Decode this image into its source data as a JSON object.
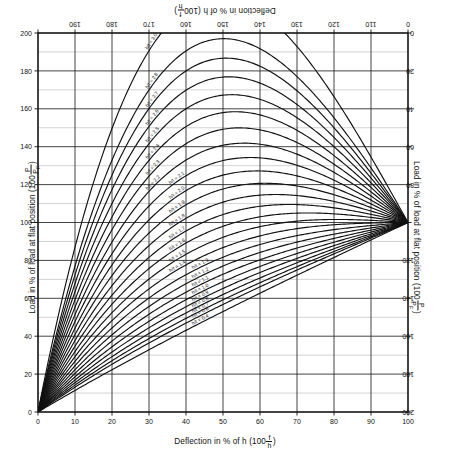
{
  "titles": {
    "top": "Deflection in % of h (100 f/h )",
    "bottom": "Deflection in % of h (100 f/h )",
    "left": "Load in % of load at flat position (100 P/P_F )",
    "right": "Load in % of load at flat position (100 P/P_F )",
    "bottom_prefix": "Deflection in % of h (100",
    "bottom_suffix": ")",
    "side_prefix": "Load in % of load at flat position (100",
    "side_suffix": ")",
    "frac_defl_num": "f",
    "frac_defl_den": "h",
    "frac_load_num": "P",
    "frac_load_den": "P",
    "frac_load_den_sub": "F"
  },
  "chart_data": {
    "type": "line",
    "xlabel": "Deflection in % of h (100 f/h)",
    "ylabel": "Load in % of load at flat position (100 P/P_F)",
    "xlim": [
      0,
      100
    ],
    "ylim": [
      0,
      200
    ],
    "grid": true,
    "legend": "inline-curve-labels",
    "x_ticks": [
      0,
      10,
      20,
      30,
      40,
      50,
      60,
      70,
      80,
      90,
      100
    ],
    "x_ticklabels": [
      "0",
      "10",
      "20",
      "30",
      "40",
      "50",
      "60",
      "70",
      "80",
      "90",
      "100"
    ],
    "y_ticks": [
      0,
      20,
      40,
      60,
      80,
      100,
      120,
      140,
      160,
      180,
      200
    ],
    "y_ticklabels": [
      "0",
      "20",
      "40",
      "60",
      "80",
      "100",
      "120",
      "140",
      "160",
      "180",
      "200"
    ],
    "top_axis_ticks": [
      10,
      20,
      30,
      40,
      50,
      60,
      70,
      80,
      90,
      100
    ],
    "top_axis_ticklabels": [
      "190",
      "180",
      "170",
      "160",
      "150",
      "140",
      "130",
      "120",
      "110",
      "0"
    ],
    "right_axis_ticks": [
      200,
      180,
      160,
      140,
      120,
      100,
      80,
      60,
      40,
      20,
      0
    ],
    "right_axis_ticklabels": [
      "0",
      "20",
      "40",
      "60",
      "80",
      "",
      "120",
      "140",
      "160",
      "180",
      "200"
    ],
    "x_minor_step": 10,
    "y_minor_step": 10,
    "converge_point": [
      100,
      100
    ],
    "origin_point": [
      0,
      0
    ],
    "series": [
      {
        "name": "h/t = 3.0",
        "ratio": 3.0,
        "label": "h/t = 3.0"
      },
      {
        "name": "h/t = 2.8",
        "ratio": 2.8,
        "label": "h/t = 2.8"
      },
      {
        "name": "h/t = 2.7",
        "ratio": 2.7,
        "label": "h/t = 2.7"
      },
      {
        "name": "h/t = 2.6",
        "ratio": 2.6,
        "label": "h/t = 2.6"
      },
      {
        "name": "h/t = 2.5",
        "ratio": 2.5,
        "label": "h/t = 2.5"
      },
      {
        "name": "h/t = 2.4",
        "ratio": 2.4,
        "label": "h/t = 2.4"
      },
      {
        "name": "h/t = 2.3",
        "ratio": 2.3,
        "label": "h/t = 2.3"
      },
      {
        "name": "h/t = 2.2",
        "ratio": 2.2,
        "label": "h/t = 2.2"
      },
      {
        "name": "h/t = 2.1",
        "ratio": 2.1,
        "label": "h/t = 2.1"
      },
      {
        "name": "h/t = 2.0",
        "ratio": 2.0,
        "label": "h/t = 2.0"
      },
      {
        "name": "h/t = 1.9",
        "ratio": 1.9,
        "label": "h/t = 1.9"
      },
      {
        "name": "h/t = 1.8",
        "ratio": 1.8,
        "label": "h/t = 1.8"
      },
      {
        "name": "h/t = 1.7",
        "ratio": 1.7,
        "label": "h/t = 1.7"
      },
      {
        "name": "h/t = 1.6",
        "ratio": 1.6,
        "label": "h/t = 1.6"
      },
      {
        "name": "h/t = 1.5",
        "ratio": 1.5,
        "label": "h/t = 1.5"
      },
      {
        "name": "h/t = 1.4",
        "ratio": 1.4,
        "label": "h/t = 1.4"
      },
      {
        "name": "h/t = 1.3",
        "ratio": 1.3,
        "label": "h/t = 1.3"
      },
      {
        "name": "h/t = 1.2",
        "ratio": 1.2,
        "label": "h/t = 1.2"
      },
      {
        "name": "h/t = 1.1",
        "ratio": 1.1,
        "label": "h/t = 1.1"
      },
      {
        "name": "h/t = 1.0",
        "ratio": 1.0,
        "label": "h/t = 1.0"
      },
      {
        "name": "h/t = 0.9",
        "ratio": 0.9,
        "label": "h/t = 0.9"
      },
      {
        "name": "h/t = 0.8",
        "ratio": 0.8,
        "label": "h/t = 0.8"
      },
      {
        "name": "h/t = 0.7",
        "ratio": 0.7,
        "label": "h/t = 0.7"
      },
      {
        "name": "h/t = 0.6",
        "ratio": 0.6,
        "label": "h/t = 0.6"
      },
      {
        "name": "h/t = 0.4",
        "ratio": 0.4,
        "label": "h/t = 0.4"
      }
    ]
  },
  "plot_geometry": {
    "left": 38,
    "right": 408,
    "top": 33,
    "bottom": 412
  }
}
